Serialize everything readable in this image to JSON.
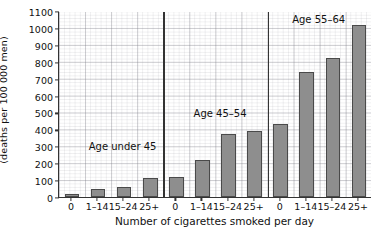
{
  "chart_data": {
    "type": "bar",
    "title": "",
    "xlabel": "Number of cigarettes smoked per day",
    "ylabel_line1": "Annual death rate",
    "ylabel_line2": "(deaths per 100 000 men)",
    "ylim": [
      0,
      1100
    ],
    "ytick_values": [
      0,
      100,
      200,
      300,
      400,
      500,
      600,
      700,
      800,
      900,
      1000,
      1100
    ],
    "ytick_labels": [
      "0",
      "100",
      "200",
      "300",
      "400",
      "500",
      "600",
      "700",
      "800",
      "900",
      "1000",
      "1100"
    ],
    "grid": true,
    "legend": "none",
    "categories": [
      "0",
      "1–14",
      "15–24",
      "25+"
    ],
    "groups": [
      {
        "name": "Age under 45",
        "annotation": "Age under 45",
        "categories": [
          "0",
          "1–14",
          "15–24",
          "25+"
        ],
        "values": [
          15,
          50,
          60,
          110
        ]
      },
      {
        "name": "Age 45–54",
        "annotation": "Age 45–54",
        "categories": [
          "0",
          "1–14",
          "15–24",
          "25+"
        ],
        "values": [
          120,
          220,
          370,
          390
        ]
      },
      {
        "name": "Age 55–64",
        "annotation": "Age 55–64",
        "categories": [
          "0",
          "1–14",
          "15–24",
          "25+"
        ],
        "values": [
          430,
          740,
          820,
          1020
        ]
      }
    ],
    "bar_color": "#8e8e8e",
    "bar_edge_color": "#4a4a4a",
    "axis_color": "#333333",
    "grid_color": "#9a9aa2"
  }
}
